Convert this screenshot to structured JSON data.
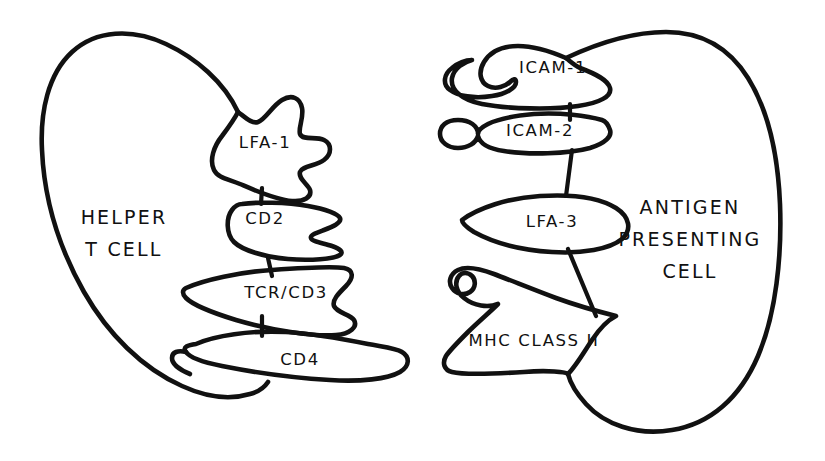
{
  "figure": {
    "type": "diagram",
    "ink_color": "#111111",
    "background_color": "#ffffff"
  },
  "cells": {
    "left": {
      "name": "helper-t-cell",
      "label_lines": [
        "HELPER",
        "T CELL"
      ]
    },
    "right": {
      "name": "antigen-presenting-cell",
      "label_lines": [
        "ANTIGEN",
        "PRESENTING",
        "CELL"
      ]
    }
  },
  "receptors": {
    "left": [
      {
        "id": "lfa1",
        "label": "LFA-1"
      },
      {
        "id": "cd2",
        "label": "CD2"
      },
      {
        "id": "tcrcd3",
        "label": "TCR/CD3"
      },
      {
        "id": "cd4",
        "label": "CD4"
      }
    ],
    "right": [
      {
        "id": "icam1",
        "label": "ICAM-1"
      },
      {
        "id": "icam2",
        "label": "ICAM-2"
      },
      {
        "id": "lfa3",
        "label": "LFA-3"
      },
      {
        "id": "mhc2",
        "label": "MHC CLASS II"
      }
    ]
  },
  "connections": [
    {
      "from": "LFA-1",
      "to": "CD2"
    },
    {
      "from": "CD2",
      "to": "TCR/CD3"
    },
    {
      "from": "TCR/CD3",
      "to": "CD4"
    },
    {
      "from": "ICAM-1",
      "to": "ICAM-2"
    },
    {
      "from": "ICAM-2",
      "to": "LFA-3"
    },
    {
      "from": "LFA-3",
      "to": "MHC CLASS II"
    }
  ]
}
